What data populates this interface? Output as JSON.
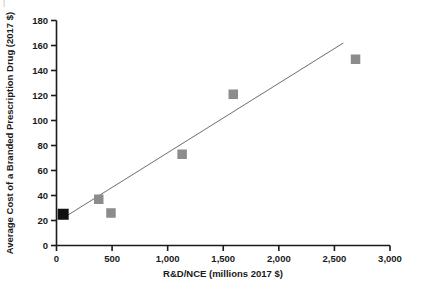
{
  "chart_data": {
    "type": "scatter",
    "title": "",
    "xlabel": "R&D/NCE (millions 2017 $)",
    "ylabel": "Average Cost of a Branded Prescription Drug (2017 $)",
    "xlim": [
      0,
      3000
    ],
    "ylim": [
      0,
      180
    ],
    "grid": false,
    "legend": "none",
    "xticks": [
      0,
      500,
      1000,
      1500,
      2000,
      2500,
      3000
    ],
    "xtick_labels": [
      "0",
      "500",
      "1,000",
      "1,500",
      "2,000",
      "2,500",
      "3,000"
    ],
    "yticks": [
      0,
      20,
      40,
      60,
      80,
      100,
      120,
      140,
      160,
      180
    ],
    "ytick_labels": [
      "0",
      "20",
      "40",
      "60",
      "80",
      "100",
      "120",
      "140",
      "160",
      "180"
    ],
    "series": [
      {
        "name": "highlighted-point",
        "marker": "square",
        "color": "#111111",
        "points": [
          {
            "x": 60,
            "y": 25
          }
        ]
      },
      {
        "name": "data-points",
        "marker": "square",
        "color": "#8c8c8c",
        "points": [
          {
            "x": 380,
            "y": 37
          },
          {
            "x": 490,
            "y": 26
          },
          {
            "x": 1130,
            "y": 73
          },
          {
            "x": 1590,
            "y": 121
          },
          {
            "x": 2690,
            "y": 149
          }
        ]
      }
    ],
    "trendline": {
      "name": "linear-fit",
      "color": "#6e6e6e",
      "x0": 60,
      "y0": 22,
      "x1": 2580,
      "y1": 162
    }
  },
  "axes": {
    "x_axis_label": "R&D/NCE (millions 2017 $)",
    "y_axis_label": "Average Cost of a Branded Prescription Drug (2017 $)"
  },
  "colors": {
    "axis": "#1a1a1a",
    "marker_gray": "#8c8c8c",
    "marker_black": "#111111",
    "trendline": "#6e6e6e",
    "background": "#ffffff"
  }
}
